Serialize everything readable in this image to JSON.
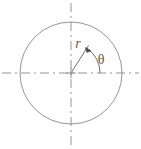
{
  "figure": {
    "type": "polar-coordinate-diagram",
    "background_color": "#fefefe",
    "line_color": "#8a8a8a",
    "label_color": "#5a5a5a"
  },
  "labels": {
    "radius": "r",
    "angle": "θ"
  },
  "geometry": {
    "center": {
      "x": 71,
      "y": 73
    },
    "circle_radius": 51,
    "radius_vector": {
      "angle_degrees": 57,
      "length": 33,
      "tip": {
        "x": 88,
        "y": 46
      }
    },
    "angle_arc": {
      "radius": 29,
      "start_degrees": 0,
      "end_degrees": 57
    },
    "horizontal_axis": {
      "x_start": 2,
      "x_end": 139,
      "y": 73
    },
    "vertical_axis": {
      "y_start": 3,
      "y_end": 146,
      "x": 71
    }
  },
  "styles": {
    "axis_dash_pattern": "9 4 2 4",
    "stroke_width": 0.9
  }
}
